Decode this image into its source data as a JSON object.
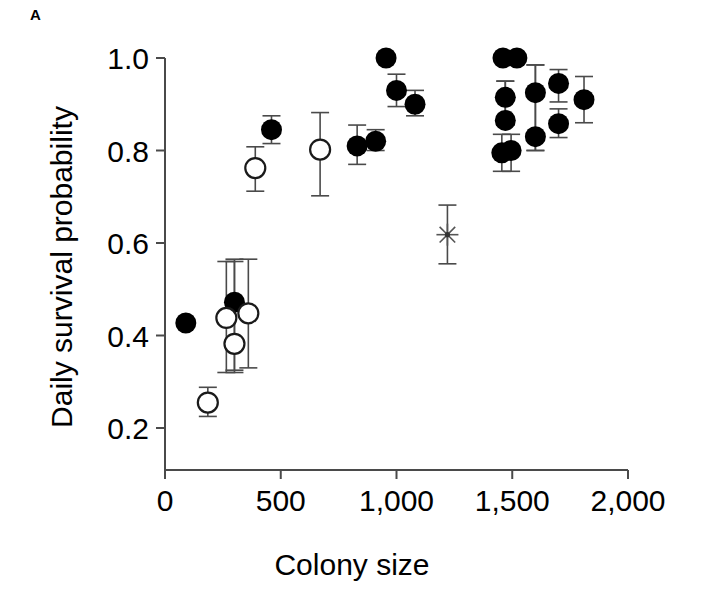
{
  "figure": {
    "panel_label": "A",
    "background": "#ffffff",
    "marker_colors": {
      "filled": "#000000",
      "open_fill": "#ffffff",
      "open_stroke": "#1a1a1a",
      "star": "#555555",
      "axis": "#4a4a4a"
    }
  },
  "chart_data": {
    "type": "scatter",
    "title": "",
    "xlabel": "Colony size",
    "ylabel": "Daily survival probability",
    "xlim": [
      0,
      2000
    ],
    "ylim": [
      0.12,
      1.04
    ],
    "xticks": [
      0,
      500,
      1000,
      1500,
      2000
    ],
    "xticklabels": [
      "0",
      "500",
      "1,000",
      "1,500",
      "2,000"
    ],
    "yticks": [
      0.2,
      0.4,
      0.6,
      0.8,
      1.0
    ],
    "yticklabels": [
      "0.2",
      "0.4",
      "0.6",
      "0.8",
      "1.0"
    ],
    "grid": false,
    "legend": null,
    "error_bars": "vertical",
    "series": [
      {
        "name": "filled-circle",
        "marker": "filled circle",
        "points": [
          {
            "x": 90,
            "y": 0.427,
            "yerr_low": null,
            "yerr_high": null
          },
          {
            "x": 300,
            "y": 0.472,
            "yerr_low": 0.325,
            "yerr_high": 0.565
          },
          {
            "x": 460,
            "y": 0.845,
            "yerr_low": 0.815,
            "yerr_high": 0.875
          },
          {
            "x": 830,
            "y": 0.81,
            "yerr_low": 0.77,
            "yerr_high": 0.855
          },
          {
            "x": 910,
            "y": 0.82,
            "yerr_low": 0.8,
            "yerr_high": 0.845
          },
          {
            "x": 955,
            "y": 1.0,
            "yerr_low": null,
            "yerr_high": null
          },
          {
            "x": 1000,
            "y": 0.93,
            "yerr_low": 0.895,
            "yerr_high": 0.965
          },
          {
            "x": 1080,
            "y": 0.9,
            "yerr_low": 0.875,
            "yerr_high": 0.93
          },
          {
            "x": 1460,
            "y": 1.0,
            "yerr_low": null,
            "yerr_high": null
          },
          {
            "x": 1520,
            "y": 1.0,
            "yerr_low": null,
            "yerr_high": null
          },
          {
            "x": 1470,
            "y": 0.915,
            "yerr_low": 0.855,
            "yerr_high": 0.95
          },
          {
            "x": 1470,
            "y": 0.865,
            "yerr_low": 0.855,
            "yerr_high": 0.95
          },
          {
            "x": 1455,
            "y": 0.795,
            "yerr_low": 0.755,
            "yerr_high": 0.835
          },
          {
            "x": 1495,
            "y": 0.8,
            "yerr_low": 0.755,
            "yerr_high": 0.835
          },
          {
            "x": 1600,
            "y": 0.925,
            "yerr_low": 0.8,
            "yerr_high": 0.985
          },
          {
            "x": 1600,
            "y": 0.83,
            "yerr_low": 0.8,
            "yerr_high": 0.985
          },
          {
            "x": 1700,
            "y": 0.945,
            "yerr_low": 0.905,
            "yerr_high": 0.975
          },
          {
            "x": 1700,
            "y": 0.858,
            "yerr_low": 0.828,
            "yerr_high": 0.89
          },
          {
            "x": 1810,
            "y": 0.91,
            "yerr_low": 0.86,
            "yerr_high": 0.96
          }
        ]
      },
      {
        "name": "open-circle",
        "marker": "open circle",
        "points": [
          {
            "x": 185,
            "y": 0.255,
            "yerr_low": 0.225,
            "yerr_high": 0.288
          },
          {
            "x": 265,
            "y": 0.438,
            "yerr_low": 0.32,
            "yerr_high": 0.56
          },
          {
            "x": 300,
            "y": 0.382,
            "yerr_low": 0.32,
            "yerr_high": 0.56
          },
          {
            "x": 360,
            "y": 0.448,
            "yerr_low": 0.33,
            "yerr_high": 0.565
          },
          {
            "x": 390,
            "y": 0.762,
            "yerr_low": 0.712,
            "yerr_high": 0.808
          },
          {
            "x": 670,
            "y": 0.802,
            "yerr_low": 0.702,
            "yerr_high": 0.882
          }
        ]
      },
      {
        "name": "asterisk",
        "marker": "asterisk",
        "points": [
          {
            "x": 1220,
            "y": 0.618,
            "yerr_low": 0.555,
            "yerr_high": 0.682
          }
        ]
      }
    ]
  }
}
